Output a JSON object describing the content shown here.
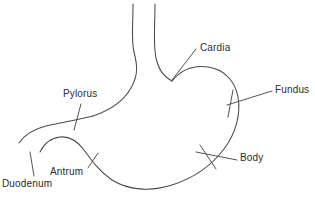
{
  "diagram": {
    "stroke_color": "#4a4a4a",
    "text_color": "#2b2b2b",
    "background_color": "#ffffff",
    "width": 315,
    "height": 201,
    "labels": [
      {
        "id": "cardia",
        "text": "Cardia",
        "x": 200,
        "y": 44
      },
      {
        "id": "fundus",
        "text": "Fundus",
        "x": 275,
        "y": 86
      },
      {
        "id": "body",
        "text": "Body",
        "x": 240,
        "y": 154
      },
      {
        "id": "pylorus",
        "text": "Pylorus",
        "x": 63,
        "y": 89
      },
      {
        "id": "antrum",
        "text": "Antrum",
        "x": 50,
        "y": 167
      },
      {
        "id": "duodenum",
        "text": "Duodenum",
        "x": 2,
        "y": 179
      }
    ],
    "structures": [
      {
        "id": "esophagus-left-wall",
        "kind": "outline"
      },
      {
        "id": "esophagus-right-wall",
        "kind": "outline"
      },
      {
        "id": "fundus-and-greater-curvature",
        "kind": "outline"
      },
      {
        "id": "lesser-curvature",
        "kind": "outline"
      },
      {
        "id": "duodenum-upper-wall",
        "kind": "outline"
      },
      {
        "id": "duodenum-lower-wall",
        "kind": "outline"
      }
    ],
    "leaders": [
      {
        "id": "cardia-leader",
        "kind": "pointer"
      },
      {
        "id": "fundus-leader",
        "kind": "tick"
      },
      {
        "id": "body-leader",
        "kind": "tick"
      },
      {
        "id": "pylorus-leader",
        "kind": "tick"
      },
      {
        "id": "antrum-leader",
        "kind": "pointer"
      },
      {
        "id": "duodenum-leader",
        "kind": "pointer"
      }
    ]
  }
}
